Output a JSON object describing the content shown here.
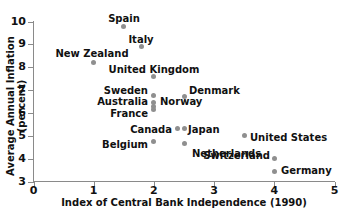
{
  "chart_data": {
    "type": "scatter",
    "title": "",
    "xlabel": "Index of Central Bank Independence (1990)",
    "ylabel": "Average Annual Inflation (percent)",
    "xlim": [
      0,
      5
    ],
    "ylim": [
      3,
      10
    ],
    "xticks": [
      "0",
      "1",
      "2",
      "3",
      "4",
      "5"
    ],
    "yticks": [
      "3",
      "4",
      "5",
      "6",
      "7",
      "8",
      "9",
      "10"
    ],
    "grid": false,
    "legend": "none",
    "marker_color": "#8f8f8f",
    "axis_color": "#8a8a8a",
    "text_color": "#111111",
    "points": [
      {
        "label": "Spain",
        "x": 1.5,
        "y": 9.8,
        "lx": 124,
        "ly": 13,
        "align": "center"
      },
      {
        "label": "Italy",
        "x": 1.8,
        "y": 8.9,
        "lx": 141,
        "ly": 34,
        "align": "center"
      },
      {
        "label": "New Zealand",
        "x": 1.0,
        "y": 8.2,
        "lx": 92,
        "ly": 48,
        "align": "center"
      },
      {
        "label": "United Kingdom",
        "x": 2.0,
        "y": 7.6,
        "lx": 154,
        "ly": 64,
        "align": "center"
      },
      {
        "label": "Sweden",
        "x": 2.0,
        "y": 6.75,
        "lx": 148,
        "ly": 85,
        "align": "right"
      },
      {
        "label": "Denmark",
        "x": 2.5,
        "y": 6.7,
        "lx": 189,
        "ly": 85,
        "align": "left"
      },
      {
        "label": "Australia",
        "x": 2.0,
        "y": 6.45,
        "lx": 148,
        "ly": 96,
        "align": "right"
      },
      {
        "label": "Norway",
        "x": 2.0,
        "y": 6.3,
        "lx": 160,
        "ly": 96,
        "align": "left"
      },
      {
        "label": "France",
        "x": 2.0,
        "y": 6.15,
        "lx": 148,
        "ly": 108,
        "align": "right"
      },
      {
        "label": "Canada",
        "x": 2.4,
        "y": 5.3,
        "lx": 172,
        "ly": 124,
        "align": "right"
      },
      {
        "label": "Japan",
        "x": 2.5,
        "y": 5.3,
        "lx": 188,
        "ly": 124,
        "align": "left"
      },
      {
        "label": "United States",
        "x": 3.5,
        "y": 5.0,
        "lx": 250,
        "ly": 132,
        "align": "left"
      },
      {
        "label": "Belgium",
        "x": 2.0,
        "y": 4.75,
        "lx": 148,
        "ly": 139,
        "align": "right"
      },
      {
        "label": "Netherlands",
        "x": 2.5,
        "y": 4.65,
        "lx": 192,
        "ly": 148,
        "align": "left"
      },
      {
        "label": "Switzerland",
        "x": 4.0,
        "y": 4.0,
        "lx": 270,
        "ly": 150,
        "align": "right"
      },
      {
        "label": "Germany",
        "x": 4.0,
        "y": 3.45,
        "lx": 281,
        "ly": 165,
        "align": "left"
      }
    ]
  }
}
